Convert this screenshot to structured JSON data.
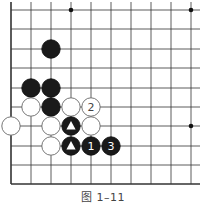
{
  "figure": {
    "caption": "图 1–11",
    "grid": {
      "x": [
        11,
        31,
        51,
        71,
        91,
        111,
        131,
        151,
        171,
        191
      ],
      "y": [
        10,
        29,
        49,
        68,
        88,
        107,
        126,
        146,
        165,
        184
      ],
      "line_extend_right": 200,
      "line_extend_top": 2,
      "edges": [
        "left",
        "bottom"
      ]
    },
    "star_points": [
      [
        3,
        0
      ],
      [
        9,
        0
      ],
      [
        9,
        6
      ]
    ],
    "stones": [
      {
        "col": 2,
        "row": 2,
        "color": "black",
        "label": ""
      },
      {
        "col": 1,
        "row": 4,
        "color": "black",
        "label": ""
      },
      {
        "col": 2,
        "row": 4,
        "color": "black",
        "label": ""
      },
      {
        "col": 1,
        "row": 5,
        "color": "white",
        "label": ""
      },
      {
        "col": 2,
        "row": 5,
        "color": "black",
        "label": ""
      },
      {
        "col": 3,
        "row": 5,
        "color": "white",
        "label": ""
      },
      {
        "col": 4,
        "row": 5,
        "color": "white",
        "label": "2"
      },
      {
        "col": 0,
        "row": 6,
        "color": "white",
        "label": ""
      },
      {
        "col": 2,
        "row": 6,
        "color": "white",
        "label": ""
      },
      {
        "col": 3,
        "row": 6,
        "color": "black",
        "label": "triangle"
      },
      {
        "col": 4,
        "row": 6,
        "color": "white",
        "label": ""
      },
      {
        "col": 2,
        "row": 7,
        "color": "white",
        "label": ""
      },
      {
        "col": 3,
        "row": 7,
        "color": "black",
        "label": "triangle"
      },
      {
        "col": 4,
        "row": 7,
        "color": "black",
        "label": "1"
      },
      {
        "col": 5,
        "row": 7,
        "color": "black",
        "label": "3"
      }
    ]
  }
}
